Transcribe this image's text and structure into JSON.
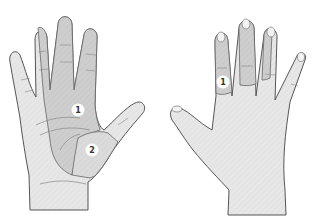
{
  "diagram": {
    "views": [
      {
        "id": "palm",
        "label_markers": [
          "1",
          "2"
        ]
      },
      {
        "id": "dorsal",
        "label_markers": [
          "1"
        ]
      }
    ],
    "markers": {
      "palm_1": "1",
      "palm_2": "2",
      "dorsal_1": "1"
    },
    "colors": {
      "skin": "#e6e6e6",
      "region_dark": "#c9c9c9",
      "region_mid": "#d6d6d6",
      "outline": "#555555",
      "badge": "#ffffff"
    }
  }
}
